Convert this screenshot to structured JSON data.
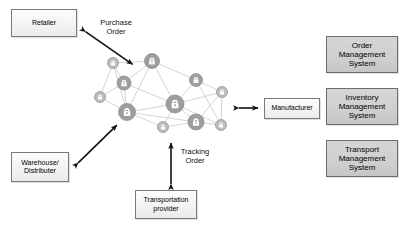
{
  "diagram": {
    "background": "#ffffff",
    "boxes": [
      {
        "id": "retailer",
        "label": "Retailer",
        "style": "light",
        "x": 11,
        "y": 9,
        "w": 66,
        "h": 28
      },
      {
        "id": "warehouse",
        "label": "Warehouse/\nDistributer",
        "style": "light",
        "x": 11,
        "y": 152,
        "w": 58,
        "h": 30
      },
      {
        "id": "manufacturer",
        "label": "Manufacturer",
        "style": "light",
        "x": 264,
        "y": 98,
        "w": 56,
        "h": 21
      },
      {
        "id": "transportation",
        "label": "Transportation\nprovider",
        "style": "light",
        "x": 135,
        "y": 190,
        "w": 62,
        "h": 29
      },
      {
        "id": "order-management-system",
        "label": "Order Management\nSystem",
        "style": "grey",
        "x": 326,
        "y": 36,
        "w": 72,
        "h": 37
      },
      {
        "id": "inventory-management-system",
        "label": "Inventory Management\nSystem",
        "style": "grey",
        "x": 326,
        "y": 88,
        "w": 72,
        "h": 37
      },
      {
        "id": "transport-management-system",
        "label": "Transport Management\nSystem",
        "style": "grey",
        "x": 326,
        "y": 140,
        "w": 72,
        "h": 37
      }
    ],
    "edge_labels": [
      {
        "id": "purchase-order",
        "label": "Purchase\nOrder",
        "x": 94,
        "y": 18,
        "w": 44
      },
      {
        "id": "tracking-order",
        "label": "Tracking\nOrder",
        "x": 177,
        "y": 147,
        "w": 36
      }
    ],
    "connectors": [
      {
        "id": "retailer-to-network",
        "from": "retailer",
        "to": "network",
        "kind": "double-arrow",
        "x1": 83,
        "y1": 30,
        "x2": 135,
        "y2": 66
      },
      {
        "id": "warehouse-to-network",
        "from": "warehouse",
        "to": "network",
        "kind": "double-arrow",
        "x1": 76,
        "y1": 165,
        "x2": 119,
        "y2": 123
      },
      {
        "id": "network-to-manufacturer",
        "from": "network",
        "to": "manufacturer",
        "kind": "double-arrow",
        "x1": 236,
        "y1": 108,
        "x2": 261,
        "y2": 108
      },
      {
        "id": "transportation-to-network",
        "from": "transportation",
        "to": "network",
        "kind": "double-arrow",
        "x1": 171,
        "y1": 187,
        "x2": 171,
        "y2": 140
      }
    ],
    "network": {
      "id": "blockchain-network",
      "node_fill": "#9e9e9e",
      "node_fill_light": "#bdbdbd",
      "node_stroke": "#8a8a8a",
      "link_stroke": "#c9c9c9",
      "lock_color": "#ffffff",
      "nodes": [
        {
          "id": "n1",
          "x": 113,
          "y": 63,
          "r": 5.5,
          "tone": "light",
          "lock": true
        },
        {
          "id": "n2",
          "x": 152,
          "y": 61,
          "r": 7.5,
          "tone": "dark",
          "lock": true
        },
        {
          "id": "n3",
          "x": 124,
          "y": 83,
          "r": 7,
          "tone": "dark",
          "lock": true
        },
        {
          "id": "n4",
          "x": 100,
          "y": 97,
          "r": 5.5,
          "tone": "light",
          "lock": true
        },
        {
          "id": "n5",
          "x": 127,
          "y": 112,
          "r": 8.5,
          "tone": "dark",
          "lock": true
        },
        {
          "id": "n6",
          "x": 163,
          "y": 127,
          "r": 5.5,
          "tone": "light",
          "lock": true
        },
        {
          "id": "n7",
          "x": 175,
          "y": 104,
          "r": 9,
          "tone": "dark",
          "lock": true
        },
        {
          "id": "n8",
          "x": 196,
          "y": 122,
          "r": 8,
          "tone": "dark",
          "lock": true
        },
        {
          "id": "n9",
          "x": 196,
          "y": 80,
          "r": 6.5,
          "tone": "dark",
          "lock": true
        },
        {
          "id": "n10",
          "x": 222,
          "y": 92,
          "r": 5.5,
          "tone": "light",
          "lock": true
        },
        {
          "id": "n11",
          "x": 221,
          "y": 125,
          "r": 5.5,
          "tone": "light",
          "lock": true
        }
      ],
      "links": [
        [
          "n1",
          "n2"
        ],
        [
          "n1",
          "n3"
        ],
        [
          "n1",
          "n4"
        ],
        [
          "n2",
          "n3"
        ],
        [
          "n2",
          "n7"
        ],
        [
          "n2",
          "n9"
        ],
        [
          "n3",
          "n4"
        ],
        [
          "n3",
          "n5"
        ],
        [
          "n3",
          "n7"
        ],
        [
          "n4",
          "n5"
        ],
        [
          "n5",
          "n6"
        ],
        [
          "n5",
          "n7"
        ],
        [
          "n6",
          "n7"
        ],
        [
          "n6",
          "n8"
        ],
        [
          "n7",
          "n8"
        ],
        [
          "n7",
          "n9"
        ],
        [
          "n7",
          "n10"
        ],
        [
          "n7",
          "n11"
        ],
        [
          "n8",
          "n11"
        ],
        [
          "n9",
          "n10"
        ],
        [
          "n9",
          "n11"
        ],
        [
          "n10",
          "n11"
        ],
        [
          "n2",
          "n5"
        ],
        [
          "n5",
          "n8"
        ],
        [
          "n1",
          "n5"
        ],
        [
          "n8",
          "n10"
        ]
      ]
    }
  }
}
